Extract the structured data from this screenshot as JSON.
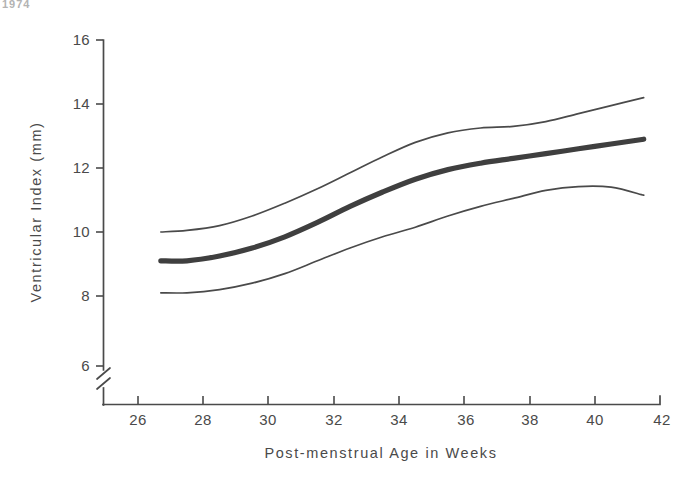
{
  "figure": {
    "corner_artifact_text": "1974",
    "background_color": "#ffffff",
    "ink_color": "#4a4a4a"
  },
  "chart_data": {
    "type": "line",
    "title": "",
    "subtitle": "",
    "xlabel": "Post-menstrual Age in Weeks",
    "ylabel": "Ventricular Index (mm)",
    "xlim": [
      25,
      42
    ],
    "ylim": [
      6,
      16
    ],
    "y_axis_broken_below": 6,
    "grid": false,
    "legend_position": "none",
    "xticks": [
      26,
      28,
      30,
      32,
      34,
      36,
      38,
      40,
      42
    ],
    "xtick_labels": [
      "26",
      "28",
      "30",
      "32",
      "34",
      "36",
      "38",
      "40",
      "42"
    ],
    "yticks": [
      6,
      8,
      10,
      12,
      14,
      16
    ],
    "ytick_labels": [
      "6",
      "8",
      "10",
      "12",
      "14",
      "16"
    ],
    "x": [
      26.7,
      27.5,
      28.5,
      29.5,
      30.5,
      31.5,
      32.5,
      33.5,
      34.5,
      35.5,
      36.5,
      37.5,
      38.5,
      39.5,
      40.5,
      41.5
    ],
    "series": [
      {
        "name": "Upper limit (97th centile)",
        "style": "thin",
        "values": [
          10.0,
          10.05,
          10.2,
          10.5,
          10.9,
          11.35,
          11.85,
          12.35,
          12.8,
          13.1,
          13.25,
          13.3,
          13.45,
          13.7,
          13.95,
          14.2
        ]
      },
      {
        "name": "Mean ventricular index",
        "style": "bold",
        "values": [
          9.1,
          9.1,
          9.25,
          9.5,
          9.85,
          10.3,
          10.8,
          11.25,
          11.65,
          11.95,
          12.15,
          12.3,
          12.45,
          12.6,
          12.75,
          12.9
        ]
      },
      {
        "name": "Lower limit (3rd centile)",
        "style": "thin",
        "values": [
          8.1,
          8.1,
          8.2,
          8.4,
          8.7,
          9.1,
          9.5,
          9.85,
          10.15,
          10.5,
          10.8,
          11.05,
          11.3,
          11.42,
          11.4,
          11.15
        ]
      }
    ],
    "annotations": []
  }
}
